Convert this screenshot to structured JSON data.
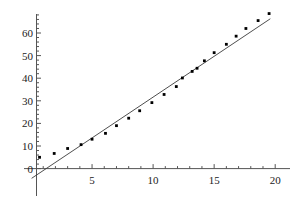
{
  "chart_data": {
    "type": "scatter",
    "title": "",
    "xlabel": "",
    "ylabel": "",
    "xlim": [
      -0.6,
      20.6
    ],
    "ylim": [
      -6,
      72
    ],
    "grid": false,
    "legend": null,
    "xticks_major": [
      5,
      10,
      15,
      20
    ],
    "xticks_minor": [
      1,
      2,
      3,
      4,
      6,
      7,
      8,
      9,
      11,
      12,
      13,
      14,
      16,
      17,
      18,
      19
    ],
    "yticks_major": [
      0,
      10,
      20,
      30,
      40,
      50,
      60
    ],
    "yticks_minor": [
      2,
      4,
      6,
      8,
      12,
      14,
      16,
      18,
      22,
      24,
      26,
      28,
      32,
      34,
      36,
      38,
      42,
      44,
      46,
      48,
      52,
      54,
      56,
      58,
      62,
      64,
      66,
      68
    ],
    "xtick_labels": [
      "5",
      "10",
      "15",
      "20"
    ],
    "ytick_labels": [
      "0",
      "10",
      "20",
      "30",
      "40",
      "50",
      "60"
    ],
    "series": [
      {
        "name": "data-points",
        "marker": "square",
        "color": "#000000",
        "points": [
          [
            0.7,
            5.0
          ],
          [
            1.9,
            6.7
          ],
          [
            3.0,
            8.9
          ],
          [
            4.1,
            10.6
          ],
          [
            5.0,
            13.0
          ],
          [
            6.1,
            15.6
          ],
          [
            7.0,
            19.0
          ],
          [
            8.0,
            22.3
          ],
          [
            8.9,
            25.6
          ],
          [
            9.9,
            29.2
          ],
          [
            10.9,
            32.8
          ],
          [
            11.9,
            36.3
          ],
          [
            12.4,
            40.1
          ],
          [
            13.2,
            43.0
          ],
          [
            13.6,
            44.4
          ],
          [
            14.2,
            47.7
          ],
          [
            15.0,
            51.3
          ],
          [
            16.0,
            55.0
          ],
          [
            16.8,
            58.6
          ],
          [
            17.6,
            62.0
          ],
          [
            18.6,
            65.5
          ],
          [
            19.5,
            68.6
          ]
        ]
      }
    ],
    "fit_line": {
      "name": "linear-fit",
      "color": "#3a3a3a",
      "x_start": 0.05,
      "y_start": -4.3,
      "x_end": 19.6,
      "y_end": 66.3,
      "slope": 3.61,
      "intercept": -4.48
    },
    "axis_color": "#555555"
  }
}
